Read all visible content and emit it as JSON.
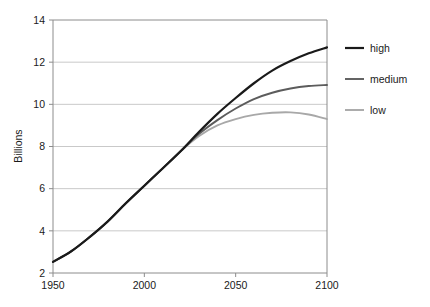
{
  "chart_data": {
    "type": "line",
    "title": "",
    "xlabel": "",
    "ylabel": "Billions",
    "xlim": [
      1950,
      2100
    ],
    "ylim": [
      2,
      14
    ],
    "xticks": [
      "1950",
      "2000",
      "2050",
      "2100"
    ],
    "xtick_values": [
      1950,
      2000,
      2050,
      2100
    ],
    "yticks": [
      "2",
      "4",
      "6",
      "8",
      "10",
      "12",
      "14"
    ],
    "ytick_values": [
      2,
      4,
      6,
      8,
      10,
      12,
      14
    ],
    "grid": "horizontal",
    "legend_position": "right",
    "x": [
      1950,
      1960,
      1970,
      1980,
      1990,
      2000,
      2010,
      2020,
      2030,
      2040,
      2050,
      2060,
      2070,
      2080,
      2090,
      2100
    ],
    "series": [
      {
        "name": "high",
        "color": "#1a1a1a",
        "values": [
          2.53,
          3.03,
          3.7,
          4.45,
          5.32,
          6.14,
          6.96,
          7.79,
          8.7,
          9.55,
          10.3,
          11.0,
          11.6,
          12.05,
          12.42,
          12.7
        ]
      },
      {
        "name": "medium",
        "color": "#5c5c5c",
        "values": [
          2.53,
          3.03,
          3.7,
          4.45,
          5.32,
          6.14,
          6.96,
          7.79,
          8.6,
          9.25,
          9.8,
          10.25,
          10.55,
          10.75,
          10.87,
          10.92
        ]
      },
      {
        "name": "low",
        "color": "#a8a8a8",
        "values": [
          2.53,
          3.03,
          3.7,
          4.45,
          5.32,
          6.14,
          6.96,
          7.79,
          8.5,
          9.0,
          9.3,
          9.5,
          9.6,
          9.62,
          9.52,
          9.3
        ]
      }
    ],
    "legend": [
      {
        "label": "high",
        "color": "#1a1a1a"
      },
      {
        "label": "medium",
        "color": "#5c5c5c"
      },
      {
        "label": "low",
        "color": "#a8a8a8"
      }
    ],
    "colors": {
      "axis": "#8c8c8c",
      "grid": "#c9c9c9",
      "text": "#1a1a1a",
      "background": "#ffffff"
    }
  }
}
